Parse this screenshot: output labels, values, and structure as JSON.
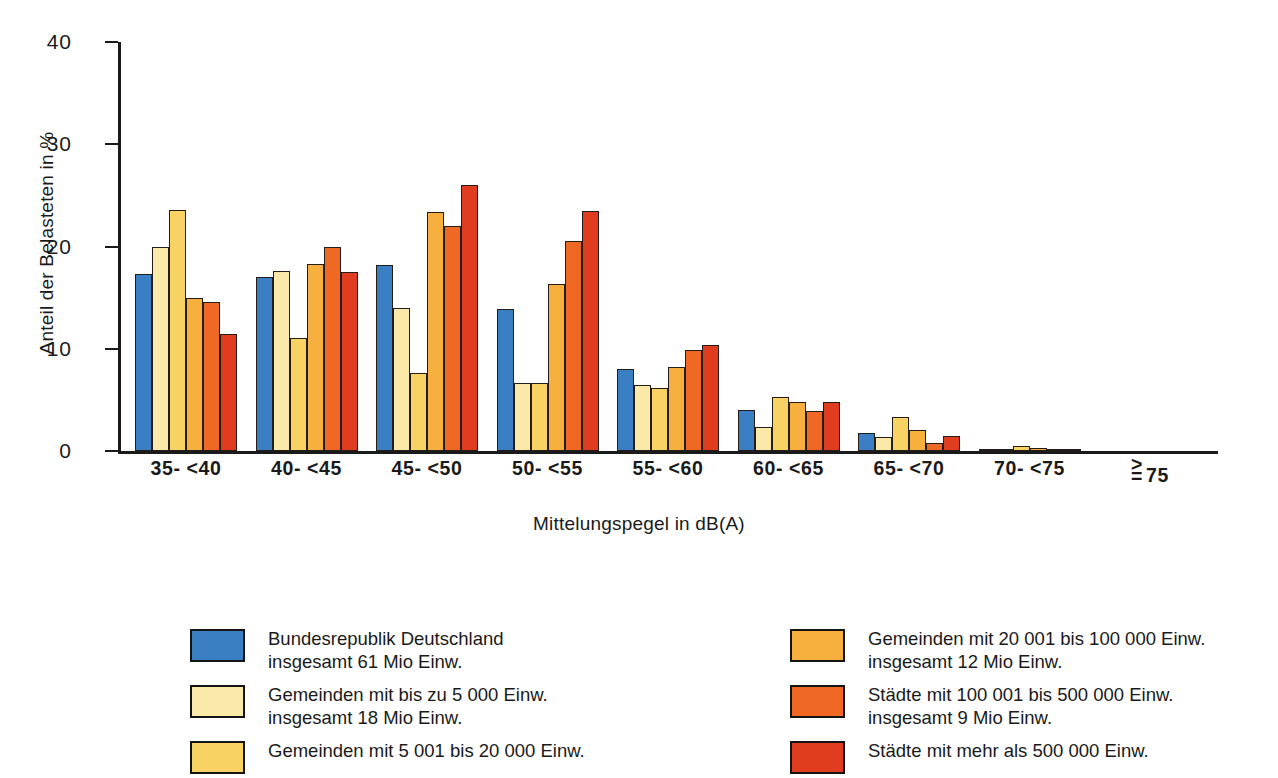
{
  "chart_data": {
    "type": "bar",
    "title": "",
    "xlabel": "Mittelungspegel in dB(A)",
    "ylabel": "Anteil der Belasteten in %",
    "ylim": [
      0,
      40
    ],
    "yticks": [
      0,
      10,
      20,
      30,
      40
    ],
    "ytick_labels": [
      "0",
      "10",
      "20",
      "30",
      "40"
    ],
    "grid": false,
    "legend_position": "below",
    "categories": [
      "35- <40",
      "40- <45",
      "45- <50",
      "50- <55",
      "55- <60",
      "60- <65",
      "65- <70",
      "70- <75",
      "≥ 75"
    ],
    "series": [
      {
        "name": "Bundesrepublik Deutschland insgesamt 61 Mio Einw.",
        "color": "#3a7fc4",
        "values": [
          17.3,
          17.0,
          18.2,
          13.9,
          8.0,
          4.0,
          1.8,
          0.15,
          0.0
        ]
      },
      {
        "name": "Gemeinden mit bis zu 5 000 Einw. insgesamt 18 Mio Einw.",
        "color": "#fae9a8",
        "values": [
          20.0,
          17.6,
          14.0,
          6.7,
          6.5,
          2.3,
          1.4,
          0.1,
          0.0
        ]
      },
      {
        "name": "Gemeinden mit 5 001 bis 20 000 Einw.",
        "color": "#f8d363",
        "values": [
          23.6,
          11.1,
          7.6,
          6.7,
          6.2,
          5.3,
          3.3,
          0.45,
          0.0
        ]
      },
      {
        "name": "Gemeinden mit 20 001 bis 100 000 Einw. insgesamt 12 Mio Einw.",
        "color": "#f7b03d",
        "values": [
          15.0,
          18.3,
          23.4,
          16.3,
          8.2,
          4.8,
          2.1,
          0.3,
          0.0
        ]
      },
      {
        "name": "Städte mit 100 001 bis 500 000 Einw. insgesamt 9 Mio Einw.",
        "color": "#ef6824",
        "values": [
          14.6,
          20.0,
          22.0,
          20.5,
          9.9,
          3.9,
          0.8,
          0.2,
          0.0
        ]
      },
      {
        "name": "Städte mit mehr als 500 000 Einw.",
        "color": "#e03c20",
        "values": [
          11.4,
          17.5,
          26.0,
          23.5,
          10.4,
          4.8,
          1.5,
          0.1,
          0.0
        ]
      }
    ]
  },
  "axes": {
    "ylabel": "Anteil der Belasteten in %",
    "xlabel": "Mittelungspegel in dB(A)",
    "ytick_labels": [
      "0",
      "10",
      "20",
      "30",
      "40"
    ],
    "xtick_labels": [
      "35- <40",
      "40- <45",
      "45- <50",
      "50- <55",
      "55- <60",
      "60- <65",
      "65- <70",
      "70- <75",
      "≥ 75"
    ],
    "last_label_symbol_top": ">",
    "last_label_symbol_bottom": "=",
    "last_label_value": "75"
  },
  "legend": {
    "left_column": [
      {
        "color": "#3a7fc4",
        "line1": "Bundesrepublik Deutschland",
        "line2": "insgesamt 61 Mio Einw."
      },
      {
        "color": "#fae9a8",
        "line1": "Gemeinden mit bis zu 5 000 Einw.",
        "line2": "insgesamt 18 Mio Einw."
      },
      {
        "color": "#f8d363",
        "line1": "Gemeinden mit 5 001 bis 20 000 Einw.",
        "line2": ""
      }
    ],
    "right_column": [
      {
        "color": "#f7b03d",
        "line1": "Gemeinden mit 20 001 bis 100 000 Einw.",
        "line2": "insgesamt 12 Mio Einw."
      },
      {
        "color": "#ef6824",
        "line1": "Städte mit 100 001 bis 500 000 Einw.",
        "line2": "insgesamt 9 Mio Einw."
      },
      {
        "color": "#e03c20",
        "line1": "Städte mit mehr als 500 000 Einw.",
        "line2": ""
      }
    ]
  }
}
